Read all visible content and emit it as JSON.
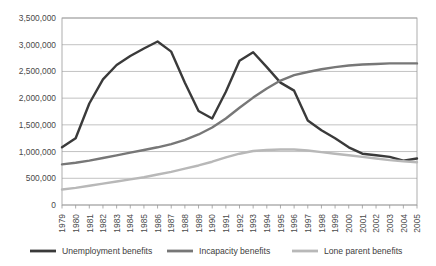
{
  "chart_data": {
    "type": "line",
    "title": "",
    "xlabel": "",
    "ylabel": "",
    "grid": true,
    "legend_position": "bottom",
    "ylim": [
      0,
      3500000
    ],
    "ytick_labels": [
      "0",
      "500,000",
      "1,000,000",
      "1,500,000",
      "2,000,000",
      "2,500,000",
      "3,000,000",
      "3,500,000"
    ],
    "ytick_values": [
      0,
      500000,
      1000000,
      1500000,
      2000000,
      2500000,
      3000000,
      3500000
    ],
    "categories": [
      "1979",
      "1980",
      "1981",
      "1982",
      "1983",
      "1984",
      "1985",
      "1986",
      "1987",
      "1988",
      "1989",
      "1990",
      "1991",
      "1992",
      "1993",
      "1994",
      "1995",
      "1996",
      "1997",
      "1998",
      "1999",
      "2000",
      "2001",
      "2002",
      "2003",
      "2004",
      "2005"
    ],
    "series": [
      {
        "name": "Unemployment benefits",
        "color": "#3a3a3a",
        "values": [
          1080000,
          1250000,
          1900000,
          2350000,
          2620000,
          2790000,
          2930000,
          3060000,
          2870000,
          2290000,
          1760000,
          1620000,
          2120000,
          2700000,
          2860000,
          2580000,
          2290000,
          2140000,
          1580000,
          1400000,
          1250000,
          1080000,
          960000,
          930000,
          900000,
          830000,
          870000
        ]
      },
      {
        "name": "Incapacity benefits",
        "color": "#777777",
        "values": [
          760000,
          790000,
          830000,
          880000,
          930000,
          980000,
          1030000,
          1080000,
          1140000,
          1220000,
          1320000,
          1450000,
          1620000,
          1820000,
          2010000,
          2180000,
          2330000,
          2430000,
          2490000,
          2540000,
          2580000,
          2610000,
          2630000,
          2640000,
          2650000,
          2650000,
          2650000
        ]
      },
      {
        "name": "Lone parent benefits",
        "color": "#b8b8b8",
        "values": [
          290000,
          320000,
          360000,
          400000,
          440000,
          480000,
          520000,
          570000,
          620000,
          680000,
          740000,
          810000,
          890000,
          960000,
          1010000,
          1030000,
          1040000,
          1040000,
          1020000,
          990000,
          960000,
          930000,
          900000,
          870000,
          840000,
          820000,
          800000
        ]
      }
    ]
  },
  "legend": {
    "items": [
      {
        "label": "Unemployment benefits",
        "color": "#3a3a3a"
      },
      {
        "label": "Incapacity benefits",
        "color": "#777777"
      },
      {
        "label": "Lone parent benefits",
        "color": "#b8b8b8"
      }
    ]
  }
}
